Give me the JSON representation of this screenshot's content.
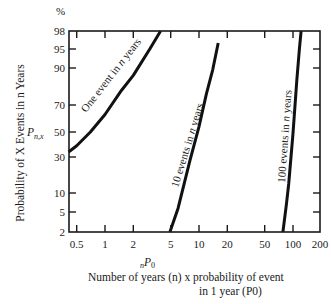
{
  "chart_data": {
    "type": "line",
    "title": "",
    "xscale": "log",
    "yscale": "probability",
    "xlabel_symbol": "nP0",
    "xlabel_line1": "Number of years (n)  x  probability of event",
    "xlabel_line2": "in 1 year (P0)",
    "ylabel": "Probability of X Events in n Years",
    "ylabel_symbol": "Pn,x",
    "yunit": "%",
    "xlim": [
      0.41,
      200
    ],
    "ylim": [
      2,
      98
    ],
    "x_ticks": [
      0.5,
      1,
      2,
      5,
      10,
      20,
      50,
      100,
      200
    ],
    "x_tick_labels": [
      "0.5",
      "1",
      "2",
      "5",
      "10",
      "20",
      "50",
      "100",
      "200"
    ],
    "y_ticks": [
      2,
      5,
      10,
      30,
      50,
      70,
      90,
      95,
      98
    ],
    "y_tick_labels": [
      "2",
      "5",
      "10",
      "30",
      "50",
      "70",
      "90",
      "95",
      "98"
    ],
    "grid": false,
    "series": [
      {
        "name": "One event in n years",
        "events": 1,
        "x": [
          0.41,
          0.5,
          0.7,
          1,
          1.5,
          2,
          3,
          3.9
        ],
        "y": [
          34,
          39,
          50,
          63,
          78,
          86,
          95,
          98
        ]
      },
      {
        "name": "10 events in n years",
        "events": 10,
        "x": [
          4.9,
          6,
          8,
          10,
          12,
          14,
          16
        ],
        "y": [
          2,
          6,
          28,
          54,
          76,
          89,
          96
        ]
      },
      {
        "name": "100 events in n years",
        "events": 100,
        "x": [
          78,
          85,
          90,
          100,
          110,
          117,
          122
        ],
        "y": [
          2,
          7,
          15,
          49,
          84,
          95,
          98
        ]
      }
    ]
  },
  "labels": {
    "percent": "%",
    "ysym_main": "P",
    "ysym_sub": "n,x",
    "xsym_pre": "n",
    "xsym_main": "P",
    "xsym_sub": "0"
  }
}
